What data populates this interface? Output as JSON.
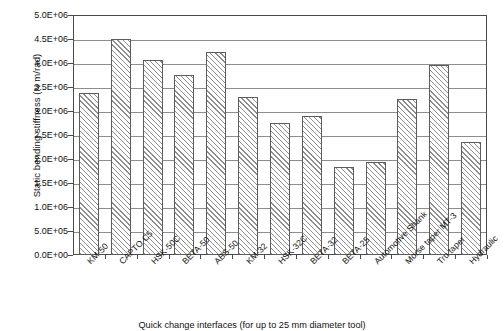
{
  "chart_data": {
    "type": "bar",
    "title": "",
    "xlabel": "Quick change interfaces (for up to 25 mm diameter tool)",
    "ylabel": "Static bending stiffness (N m/rad)",
    "ylim": [
      0,
      5000000
    ],
    "ytick_values": [
      0,
      500000,
      1000000,
      1500000,
      2000000,
      2500000,
      3000000,
      3500000,
      4000000,
      4500000,
      5000000
    ],
    "ytick_labels": [
      "0.0E+00",
      "5.0E+05",
      "1.0E+06",
      "1.5E+06",
      "2.0E+06",
      "2.5E+06",
      "3.0E+06",
      "3.5E+06",
      "4.0E+06",
      "4.5E+06",
      "5.0E+06"
    ],
    "grid": true,
    "legend": "none",
    "categories": [
      "KM-50",
      "CAPTO C5",
      "HSK-50C",
      "BETA-50",
      "ABS-50",
      "KM-32",
      "HSK-32C",
      "BETA-32",
      "BETA-25",
      "Automotive Shank",
      "Morse taper MT-3",
      "Tru taper",
      "Hydraulic"
    ],
    "values": [
      3380000,
      4500000,
      4060000,
      3750000,
      4230000,
      3290000,
      2750000,
      2900000,
      1830000,
      1930000,
      3240000,
      3960000,
      2350000
    ],
    "bar_style": {
      "fill": "diagonal-hatch",
      "hatch_color": "#8e8e8e",
      "background": "#ffffff",
      "border_color": "#5c5c5c"
    },
    "axis_color": "#4a4a4a",
    "gridline_color": "#8d8d8d"
  }
}
